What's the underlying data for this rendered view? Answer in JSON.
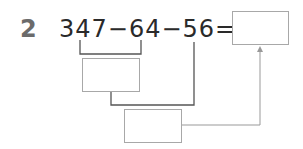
{
  "problem": {
    "number": "2",
    "expression": "347−64−56=",
    "operands": [
      "347",
      "64",
      "56"
    ],
    "operator": "−",
    "equals": "="
  },
  "boxes": {
    "answer": "",
    "step1": "",
    "step2": ""
  },
  "colors": {
    "number": "#6b6b6b",
    "text": "#2a2a2a",
    "line": "#555555",
    "box_border": "#a8a8a8",
    "arrow": "#999999"
  }
}
